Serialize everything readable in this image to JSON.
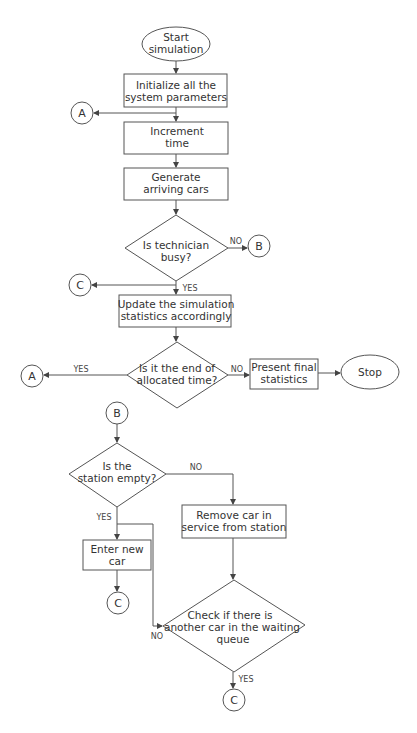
{
  "nodes": {
    "start": {
      "line1": "Start",
      "line2": "simulation"
    },
    "init": {
      "line1": "Initialize all the",
      "line2": "system parameters"
    },
    "increment": {
      "line1": "Increment",
      "line2": "time"
    },
    "generate": {
      "line1": "Generate",
      "line2": "arriving cars"
    },
    "tech_busy": {
      "line1": "Is technician",
      "line2": "busy?"
    },
    "update": {
      "line1": "Update the  simulation",
      "line2": "statistics accordingly"
    },
    "end_time": {
      "line1": "Is it the end of",
      "line2": "allocated time?"
    },
    "present": {
      "line1": "Present final",
      "line2": "statistics"
    },
    "stop": {
      "label": "Stop"
    },
    "station_empty": {
      "line1": "Is the",
      "line2": "station empty?"
    },
    "remove": {
      "line1": "Remove car in",
      "line2": "service from station"
    },
    "enter": {
      "line1": "Enter new",
      "line2": "car"
    },
    "check_queue": {
      "line1": "Check if there is",
      "line2": "another car in the waiting",
      "line3": "queue"
    }
  },
  "connectors": {
    "a1": "A",
    "b1": "B",
    "c1": "C",
    "a2": "A",
    "b2": "B",
    "c2": "C",
    "c3": "C"
  },
  "edge_labels": {
    "tech_no": "NO",
    "tech_yes": "YES",
    "end_yes": "YES",
    "end_no": "NO",
    "station_no": "NO",
    "station_yes": "YES",
    "queue_no": "NO",
    "queue_yes": "YES"
  }
}
